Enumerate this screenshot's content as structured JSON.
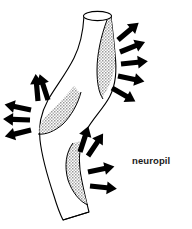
{
  "figure": {
    "background_color": "#ffffff",
    "outline_color": "#000000",
    "stipple_color": "#8a8a8a",
    "arrow_color": "#000000",
    "label_color": "#1a1a1a",
    "labels": [
      {
        "id": "neuropil",
        "text": "neuropil",
        "x": 132,
        "y": 155
      }
    ],
    "structure": {
      "name": "sinuous-tubular-process",
      "description": "open-ended cylindrical tube curving in an S shape",
      "top_opening": "elliptical rim",
      "bottom_end": "angled cut"
    },
    "shaded_patches": [
      {
        "id": "patch-upper-right",
        "position": "upper right of tube"
      },
      {
        "id": "patch-middle-left",
        "position": "middle left of tube"
      },
      {
        "id": "patch-lower-right",
        "position": "lower middle right of tube"
      }
    ],
    "arrow_clusters": [
      {
        "id": "cluster-upper-right",
        "count": 5,
        "direction": "outward right and up-right"
      },
      {
        "id": "cluster-middle-left",
        "count": 5,
        "direction": "outward left and up"
      },
      {
        "id": "cluster-lower-right",
        "count": 4,
        "direction": "outward right and up-right"
      }
    ]
  }
}
